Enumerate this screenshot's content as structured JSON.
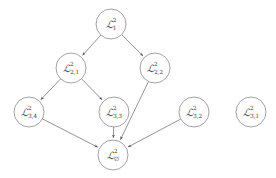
{
  "diagram": {
    "kind": "directed-acyclic-graph",
    "title": "",
    "background_color": "#ffffff",
    "node_stroke_color": "#8a8a8a",
    "node_fill_color": "#ffffff",
    "edge_color": "#6f6f6f",
    "label_color": "#3a3a3a",
    "node_radius": 15,
    "nodes": [
      {
        "id": "n1",
        "base": "ℒ",
        "superscript": "2",
        "subscript": "1",
        "label": "ℒ²₁",
        "cx": 111,
        "cy": 24,
        "level": 1
      },
      {
        "id": "n2_1",
        "base": "ℒ",
        "superscript": "2",
        "subscript": "2,1",
        "label": "ℒ²₂,₁",
        "cx": 71,
        "cy": 68,
        "level": 2
      },
      {
        "id": "n2_2",
        "base": "ℒ",
        "superscript": "2",
        "subscript": "2,2",
        "label": "ℒ²₂,₂",
        "cx": 155,
        "cy": 68,
        "level": 2
      },
      {
        "id": "n3_4",
        "base": "ℒ",
        "superscript": "2",
        "subscript": "3,4",
        "label": "ℒ²₃,₄",
        "cx": 29,
        "cy": 112,
        "level": 3
      },
      {
        "id": "n3_3",
        "base": "ℒ",
        "superscript": "2",
        "subscript": "3,3",
        "label": "ℒ²₃,₃",
        "cx": 114,
        "cy": 112,
        "level": 3
      },
      {
        "id": "n3_2",
        "base": "ℒ",
        "superscript": "2",
        "subscript": "3,2",
        "label": "ℒ²₃,₂",
        "cx": 194,
        "cy": 112,
        "level": 3
      },
      {
        "id": "n3_1",
        "base": "ℒ",
        "superscript": "2",
        "subscript": "3,1",
        "label": "ℒ²₃,₁",
        "cx": 251,
        "cy": 112,
        "level": 3
      },
      {
        "id": "nbot",
        "base": "ℒ",
        "superscript": "2",
        "subscript": "∅",
        "label": "ℒ²∅",
        "cx": 113,
        "cy": 155,
        "level": 4
      }
    ],
    "edges": [
      {
        "id": "e1",
        "from": "n1",
        "to": "n2_1",
        "arrow": true
      },
      {
        "id": "e2",
        "from": "n1",
        "to": "n2_2",
        "arrow": true
      },
      {
        "id": "e3",
        "from": "n2_1",
        "to": "n3_4",
        "arrow": true
      },
      {
        "id": "e4",
        "from": "n2_1",
        "to": "n3_3",
        "arrow": true
      },
      {
        "id": "e5",
        "from": "n2_2",
        "to": "nbot",
        "arrow": true
      },
      {
        "id": "e6",
        "from": "n3_4",
        "to": "nbot",
        "arrow": true
      },
      {
        "id": "e7",
        "from": "n3_3",
        "to": "nbot",
        "arrow": true
      },
      {
        "id": "e8",
        "from": "n3_2",
        "to": "nbot",
        "arrow": true
      }
    ],
    "isolated_nodes": [
      "n3_1"
    ]
  }
}
